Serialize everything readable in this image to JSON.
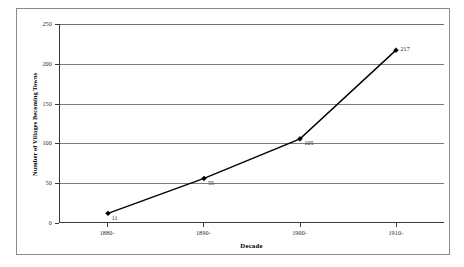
{
  "chart_data": {
    "type": "line",
    "title": "",
    "subtitle": "",
    "xlabel": "Decade",
    "ylabel": "Number of Villages Becoming Towns",
    "categories": [
      "1880-",
      "1890-",
      "1900-",
      "1910-"
    ],
    "values": [
      11,
      55,
      105,
      217
    ],
    "point_labels": [
      "11",
      "55",
      "105",
      "217"
    ],
    "ylim": [
      0,
      250
    ],
    "yticks": [
      0,
      50,
      100,
      150,
      200,
      250
    ],
    "ytick_labels": [
      "0",
      "50",
      "100",
      "150",
      "200",
      "250"
    ],
    "grid": "horizontal",
    "legend": "none",
    "series": [
      {
        "name": "Villages Becoming Towns",
        "values": [
          11,
          55,
          105,
          217
        ],
        "line_color": "#000000",
        "marker": "diamond",
        "marker_color": "#000000"
      }
    ],
    "colors": {
      "line": "#000000",
      "marker": "#000000",
      "gridline": "#7c7c7c",
      "axis": "#3a3a3a",
      "frame": "#8a8a8a",
      "background": "#ffffff",
      "text": "#000000"
    }
  }
}
